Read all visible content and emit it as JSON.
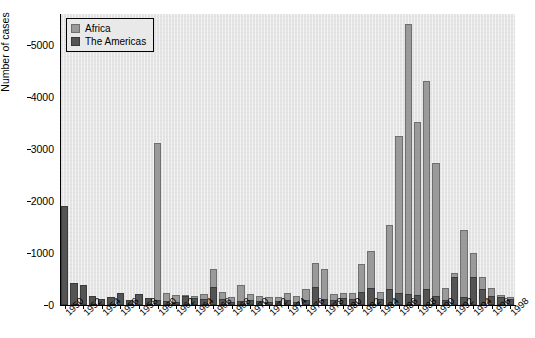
{
  "chart_data": {
    "type": "bar",
    "title": "",
    "xlabel": "",
    "ylabel": "Number of cases",
    "ylim": [
      0,
      5600
    ],
    "ytick_values": [
      0,
      1000,
      2000,
      3000,
      4000,
      5000
    ],
    "ytick_labels": [
      "0",
      "1000",
      "2000",
      "3000",
      "4000",
      "5000"
    ],
    "grid": false,
    "legend_position": "top-left",
    "bar_mode": "overlay",
    "x": [
      1950,
      1951,
      1952,
      1953,
      1954,
      1955,
      1956,
      1957,
      1958,
      1959,
      1960,
      1961,
      1962,
      1963,
      1964,
      1965,
      1966,
      1967,
      1968,
      1969,
      1970,
      1971,
      1972,
      1973,
      1974,
      1975,
      1976,
      1977,
      1978,
      1979,
      1980,
      1981,
      1982,
      1983,
      1984,
      1985,
      1986,
      1987,
      1988,
      1989,
      1990,
      1991,
      1992,
      1993,
      1994,
      1995,
      1996,
      1997,
      1998
    ],
    "xtick_labels": [
      "1950",
      "1952",
      "1954",
      "1956",
      "1958",
      "1960",
      "1962",
      "1964",
      "1966",
      "1968",
      "1970",
      "1972",
      "1974",
      "1976",
      "1978",
      "1980",
      "1982",
      "1984",
      "1986",
      "1988",
      "1990",
      "1992",
      "1994",
      "1996",
      "1998"
    ],
    "series": [
      {
        "name": "Africa",
        "color": "#9a9a9a",
        "values": [
          120,
          150,
          90,
          60,
          110,
          80,
          140,
          100,
          170,
          120,
          3120,
          230,
          190,
          200,
          170,
          220,
          700,
          260,
          150,
          380,
          210,
          180,
          150,
          160,
          230,
          170,
          300,
          810,
          700,
          210,
          240,
          230,
          790,
          1030,
          250,
          1540,
          3260,
          5400,
          3520,
          4320,
          2740,
          330,
          620,
          1450,
          1010,
          530,
          320,
          200,
          150
        ]
      },
      {
        "name": "The Americas",
        "color": "#545454",
        "values": [
          1900,
          430,
          390,
          180,
          120,
          150,
          230,
          90,
          210,
          140,
          90,
          70,
          60,
          180,
          130,
          110,
          340,
          120,
          60,
          70,
          90,
          80,
          60,
          70,
          100,
          60,
          90,
          340,
          120,
          90,
          130,
          110,
          250,
          330,
          120,
          300,
          230,
          220,
          200,
          310,
          170,
          90,
          530,
          160,
          540,
          300,
          180,
          150,
          110
        ]
      }
    ]
  },
  "legend": {
    "items": [
      {
        "label": "Africa"
      },
      {
        "label": "The Americas"
      }
    ]
  }
}
